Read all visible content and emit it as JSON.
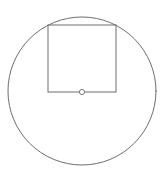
{
  "figure": {
    "background_color": "#ffffff",
    "canvas": {
      "width": 165,
      "height": 175
    },
    "stroke_color": "#6e6e70",
    "marker_stroke_color": "#7a7a7c",
    "stroke_width": 1,
    "shapes": {
      "circle": {
        "name": "outer-circle",
        "cx": 82,
        "cy": 91,
        "r": 74,
        "stroke": "#6e6e70",
        "stroke_width": 1,
        "fill": "none"
      },
      "square": {
        "name": "inscribed-square",
        "x": 48,
        "y": 25,
        "width": 68,
        "height": 67,
        "stroke": "#6e6e70",
        "stroke_width": 1,
        "fill": "none"
      },
      "center_marker": {
        "name": "center-point-marker",
        "cx": 82,
        "cy": 92,
        "r": 2.6,
        "stroke": "#7a7a7c",
        "stroke_width": 1,
        "fill": "#ffffff"
      }
    }
  }
}
